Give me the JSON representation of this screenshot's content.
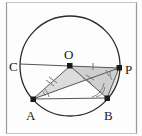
{
  "figure": {
    "type": "circle-geometry-diagram",
    "canvas": {
      "width": 142,
      "height": 136
    },
    "border_color": "#9a9a9a",
    "stroke_color": "#2b2b2b",
    "line_color": "#555555",
    "fill_color": "#d8d8d8",
    "fill_color_light": "#e6e6e6",
    "tick_color": "#777777",
    "circle": {
      "cx": 70,
      "cy": 66,
      "r": 50
    },
    "points": [
      {
        "name": "O",
        "label": "O",
        "x": 70,
        "y": 66,
        "label_x": 66,
        "label_y": 58,
        "dot": true
      },
      {
        "name": "C",
        "label": "C",
        "x": 20,
        "y": 64,
        "label_x": 8,
        "label_y": 70,
        "dot": false
      },
      {
        "name": "P",
        "label": "P",
        "x": 119,
        "y": 68,
        "label_x": 126,
        "label_y": 73,
        "dot": true
      },
      {
        "name": "A",
        "label": "A",
        "x": 33,
        "y": 99,
        "label_x": 27,
        "label_y": 118,
        "dot": true
      },
      {
        "name": "B",
        "label": "B",
        "x": 107,
        "y": 98,
        "label_x": 106,
        "label_y": 117,
        "dot": true
      }
    ],
    "segments": [
      {
        "name": "segment-CP",
        "from": "C",
        "to": "P"
      },
      {
        "name": "segment-OA",
        "from": "O",
        "to": "A",
        "ticks": 2
      },
      {
        "name": "segment-OB",
        "from": "O",
        "to": "B",
        "ticks": 2
      },
      {
        "name": "segment-AP",
        "from": "A",
        "to": "P"
      },
      {
        "name": "segment-AB",
        "from": "A",
        "to": "B"
      },
      {
        "name": "segment-BP",
        "from": "B",
        "to": "P"
      },
      {
        "name": "segment-OP",
        "from": "O",
        "to": "P",
        "ticks": 1
      }
    ],
    "angle_marks": [
      {
        "name": "angle-at-A",
        "vertex": "A"
      },
      {
        "name": "angle-at-B",
        "vertex": "B"
      },
      {
        "name": "angle-at-P-upper",
        "vertex": "P"
      },
      {
        "name": "angle-at-P-lower",
        "vertex": "P"
      }
    ],
    "shaded_regions": [
      {
        "name": "triangle-AOP",
        "vertices": "A,O,P"
      },
      {
        "name": "triangle-OBP",
        "vertices": "O,B,P"
      }
    ]
  }
}
